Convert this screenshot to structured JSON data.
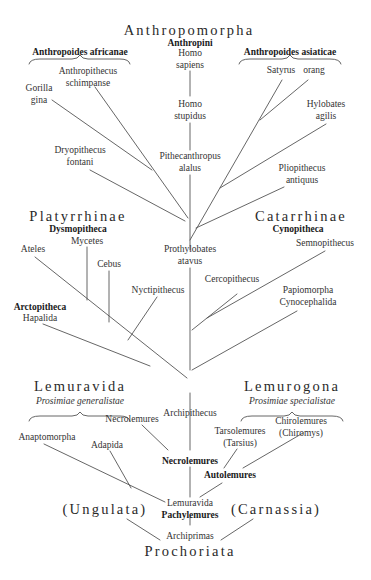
{
  "diagram": {
    "type": "phylogenetic-tree",
    "line_color": "#555555",
    "groups": {
      "anthropomorpha": {
        "title": "Anthropomorpha",
        "subtitle": "Anthropini"
      },
      "africanae": "Anthropoides africanae",
      "asiaticae": "Anthropoides asiaticae",
      "platyrrhinae": {
        "title": "Platyrrhinae",
        "subtitle": "Dysmopitheca"
      },
      "catarrhinae": {
        "title": "Catarrhinae",
        "subtitle": "Cynopitheca"
      },
      "lemuravida_group": {
        "title": "Lemuravida",
        "subtitle": "Prosimiae generalistae"
      },
      "lemurogona": {
        "title": "Lemurogona",
        "subtitle": "Prosimiae specialistae"
      },
      "ungulata": "(Ungulata)",
      "carnassia": "(Carnassia)",
      "prochoriata": "Prochoriata"
    },
    "taxa": {
      "homo_sapiens": [
        "Homo",
        "sapiens"
      ],
      "homo_stupidus": [
        "Homo",
        "stupidus"
      ],
      "pithecanthropus": [
        "Pithecanthropus",
        "alalus"
      ],
      "anthropithecus": [
        "Anthropithecus",
        "schimpanse"
      ],
      "gorilla": [
        "Gorilla",
        "gina"
      ],
      "dryopithecus": [
        "Dryopithecus",
        "fontani"
      ],
      "satyrus": "Satyrus",
      "orang": "orang",
      "hylobates": [
        "Hylobates",
        "agilis"
      ],
      "pliopithecus": [
        "Pliopithecus",
        "antiquus"
      ],
      "prothylobates": [
        "Prothylobates",
        "atavus"
      ],
      "mycetes": "Mycetes",
      "ateles": "Ateles",
      "cebus": "Cebus",
      "nyctipithecus": "Nyctipithecus",
      "arctopitheca": "Arctopitheca",
      "hapalida": "Hapalida",
      "semnopithecus": "Semnopithecus",
      "cercopithecus": "Cercopithecus",
      "papiomorpha": [
        "Papiomorpha",
        "Cynocephalida"
      ],
      "archipithecus": "Archipithecus",
      "necrolemures_small": "Necrolemures",
      "anaptomorpha": "Anaptomorpha",
      "adapida": "Adapida",
      "necrolemures_bold": "Necrolemures",
      "tarsolemures": [
        "Tarsolemures",
        "(Tarsius)"
      ],
      "chirolemures": [
        "Chirolemures",
        "(Chiromys)"
      ],
      "autolemures": "Autolemures",
      "lemuravida": "Lemuravida",
      "pachylemures": "Pachylemures",
      "archiprimas": "Archiprimas"
    }
  }
}
